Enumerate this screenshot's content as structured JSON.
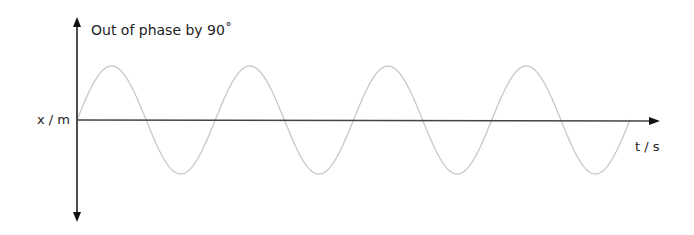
{
  "diagram": {
    "title": "Out of phase by 90˚",
    "y_axis_label": "x / m",
    "x_axis_label": "t / s",
    "colors": {
      "axes": "#222222",
      "wave": "#c8c8c8",
      "text": "#222222"
    }
  },
  "chart_data": {
    "type": "line",
    "title": "Out of phase by 90˚",
    "xlabel": "t / s",
    "ylabel": "x / m",
    "series": [
      {
        "name": "displacement",
        "shape": "sine",
        "cycles": 4,
        "phase_start": "zero, rising"
      }
    ],
    "grid": false
  }
}
